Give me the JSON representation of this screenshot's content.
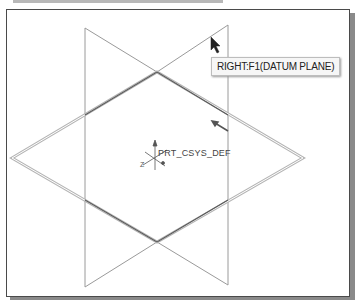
{
  "viewport": {
    "tooltip": "RIGHT:F1(DATUM PLANE)",
    "csys_label": "PRT_CSYS_DEF",
    "axis_label_z": "Z"
  },
  "colors": {
    "frame_border": "#4a4a4a",
    "plane_edge": "#8c8c8c",
    "highlight_edge": "#555555",
    "background": "#ffffff"
  }
}
